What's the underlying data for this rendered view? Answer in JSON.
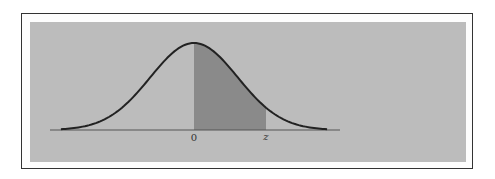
{
  "figure": {
    "labels": {
      "origin": "0",
      "z": "z"
    },
    "colors": {
      "background": "#bcbcbc",
      "shaded": "#8a8a8a",
      "curve": "#222222",
      "frame": "#333333"
    }
  },
  "chart_data": {
    "type": "area",
    "title": "",
    "xlabel": "",
    "ylabel": "",
    "distribution": "standard normal",
    "x_range": [
      -3.05,
      3.05
    ],
    "shaded_region": {
      "from": 0,
      "to": 1.65
    },
    "tick_labels": [
      "0",
      "z"
    ],
    "grid": false,
    "legend": null
  }
}
